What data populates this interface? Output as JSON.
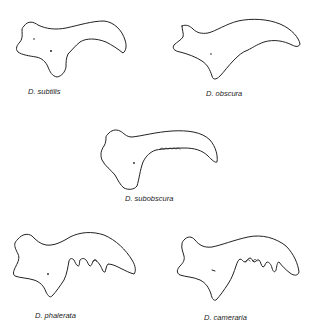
{
  "figure": {
    "specimens": [
      {
        "id": "subtilis",
        "label": "D. subtilis"
      },
      {
        "id": "obscura",
        "label": "D. obscura"
      },
      {
        "id": "subobscura",
        "label": "D. subobscura"
      },
      {
        "id": "phalerata",
        "label": "D. phalerata"
      },
      {
        "id": "cameraria",
        "label": "D. cameraria"
      }
    ],
    "colors": {
      "outline": "#222222",
      "background": "#ffffff",
      "text": "#1a1a1a"
    }
  }
}
